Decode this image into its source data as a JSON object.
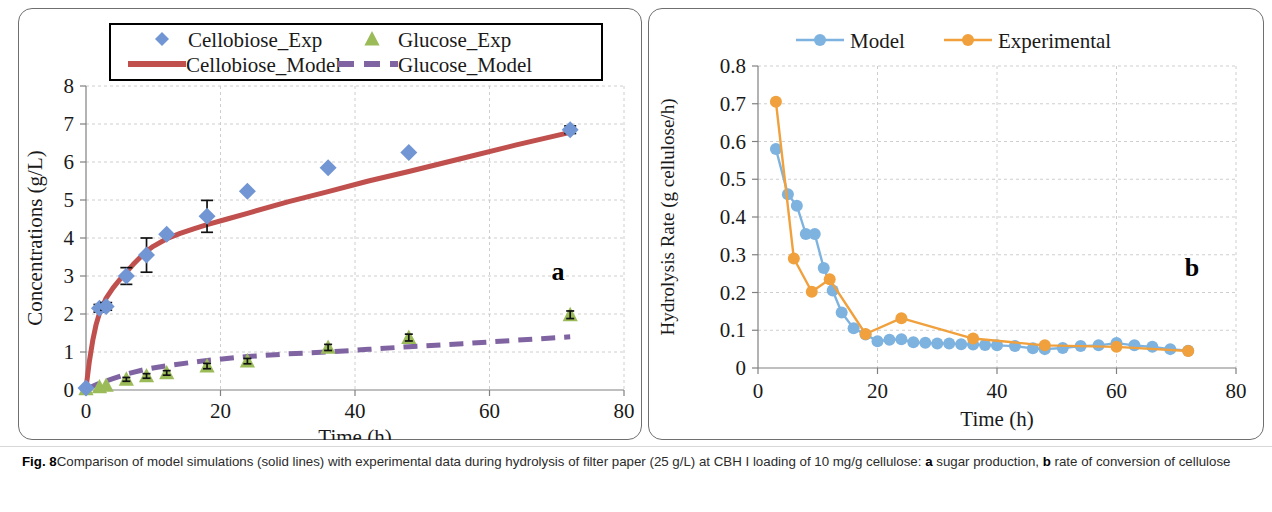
{
  "figure": {
    "label": "Fig. 8",
    "caption_part1": "Comparison of model simulations (solid lines) with experimental data during hydrolysis of filter paper (25 g/L) at CBH I loading of 10 mg/g cellulose: ",
    "caption_bold_a": "a",
    "caption_part2": " sugar production, ",
    "caption_bold_b": "b",
    "caption_part3": " rate of conversion of cellulose"
  },
  "colors": {
    "cellobiose_marker": "#7296d4",
    "cellobiose_model": "#c0504d",
    "glucose_marker": "#9bbb59",
    "glucose_model": "#8064a2",
    "model_blue": "#7eb3e0",
    "experimental_orange": "#f0a03c",
    "grid": "#c8c8c8",
    "axis": "#808080",
    "frame": "#6f6f6f"
  },
  "chart_data": [
    {
      "type": "scatter",
      "panel": "a",
      "panel_letter": "a",
      "title": "",
      "xlabel": "Time (h)",
      "ylabel": "Concentrations (g/L)",
      "xlim": [
        0,
        80
      ],
      "ylim": [
        0,
        8
      ],
      "xticks": [
        0,
        20,
        40,
        60,
        80
      ],
      "yticks": [
        0,
        1,
        2,
        3,
        4,
        5,
        6,
        7,
        8
      ],
      "grid": true,
      "legend_position": "top",
      "legend": [
        {
          "label": "Cellobiose_Exp",
          "marker": "diamond",
          "color": "#7296d4"
        },
        {
          "label": "Glucose_Exp",
          "marker": "triangle",
          "color": "#9bbb59"
        },
        {
          "label": "Cellobiose_Model",
          "marker": "solid-line",
          "color": "#c0504d"
        },
        {
          "label": "Glucose_Model",
          "marker": "dashed-line",
          "color": "#8064a2"
        }
      ],
      "series": [
        {
          "name": "Cellobiose_Exp",
          "kind": "markers",
          "marker": "diamond",
          "color": "#7296d4",
          "x": [
            0,
            2,
            3,
            6,
            9,
            12,
            18,
            24,
            36,
            48,
            72
          ],
          "y": [
            0.05,
            2.15,
            2.2,
            3.0,
            3.55,
            4.1,
            4.57,
            5.23,
            5.85,
            6.25,
            6.85
          ],
          "yerr": [
            0,
            0.1,
            0.1,
            0.22,
            0.45,
            0,
            0.42,
            0,
            0,
            0,
            0.1
          ]
        },
        {
          "name": "Glucose_Exp",
          "kind": "markers",
          "marker": "triangle",
          "color": "#9bbb59",
          "x": [
            0,
            2,
            3,
            6,
            9,
            12,
            18,
            24,
            36,
            48,
            72
          ],
          "y": [
            0.03,
            0.08,
            0.12,
            0.28,
            0.37,
            0.45,
            0.63,
            0.76,
            1.12,
            1.38,
            1.98
          ],
          "yerr": [
            0,
            0,
            0,
            0.05,
            0.06,
            0.06,
            0.07,
            0.07,
            0.08,
            0.09,
            0.1
          ]
        },
        {
          "name": "Cellobiose_Model",
          "kind": "line",
          "style": "solid",
          "color": "#c0504d",
          "x": [
            0,
            0.5,
            1,
            1.5,
            2,
            3,
            4,
            5,
            6,
            7,
            8,
            9,
            10,
            12,
            14,
            16,
            18,
            21,
            24,
            30,
            36,
            42,
            48,
            56,
            64,
            72
          ],
          "y": [
            0.05,
            0.75,
            1.3,
            1.72,
            2.02,
            2.42,
            2.68,
            2.9,
            3.1,
            3.3,
            3.48,
            3.65,
            3.78,
            3.98,
            4.12,
            4.24,
            4.35,
            4.5,
            4.65,
            4.95,
            5.22,
            5.5,
            5.75,
            6.1,
            6.45,
            6.78
          ]
        },
        {
          "name": "Glucose_Model",
          "kind": "line",
          "style": "dashed",
          "color": "#8064a2",
          "x": [
            0,
            2,
            4,
            6,
            9,
            12,
            18,
            24,
            30,
            36,
            42,
            48,
            56,
            64,
            72
          ],
          "y": [
            0.02,
            0.18,
            0.3,
            0.42,
            0.55,
            0.64,
            0.78,
            0.88,
            0.95,
            1.0,
            1.07,
            1.14,
            1.22,
            1.31,
            1.4
          ]
        }
      ]
    },
    {
      "type": "line",
      "panel": "b",
      "panel_letter": "b",
      "title": "",
      "xlabel": "Time (h)",
      "ylabel": "Hydrolysis Rate (g cellulose/h)",
      "xlim": [
        0,
        80
      ],
      "ylim": [
        0,
        0.8
      ],
      "xticks": [
        0,
        20,
        40,
        60,
        80
      ],
      "yticks": [
        0,
        0.1,
        0.2,
        0.3,
        0.4,
        0.5,
        0.6,
        0.7,
        0.8
      ],
      "ytick_labels": [
        "0",
        "0.1",
        "0.2",
        "0.3",
        "0.4",
        "0.5",
        "0.6",
        "0.7",
        "0.8"
      ],
      "grid": true,
      "legend_position": "top",
      "legend": [
        {
          "label": "Model",
          "marker": "line-circle",
          "color": "#7eb3e0"
        },
        {
          "label": "Experimental",
          "marker": "line-circle",
          "color": "#f0a03c"
        }
      ],
      "series": [
        {
          "name": "Model",
          "kind": "line-markers",
          "color": "#7eb3e0",
          "x": [
            3,
            5,
            6.5,
            8,
            9.5,
            11,
            12.5,
            14,
            16,
            18,
            20,
            22,
            24,
            26,
            28,
            30,
            32,
            34,
            36,
            38,
            40,
            43,
            46,
            48,
            51,
            54,
            57,
            60,
            63,
            66,
            69,
            72
          ],
          "y": [
            0.58,
            0.46,
            0.43,
            0.355,
            0.355,
            0.265,
            0.205,
            0.147,
            0.105,
            0.089,
            0.071,
            0.075,
            0.076,
            0.068,
            0.067,
            0.065,
            0.065,
            0.063,
            0.062,
            0.061,
            0.06,
            0.058,
            0.052,
            0.05,
            0.053,
            0.058,
            0.06,
            0.066,
            0.06,
            0.056,
            0.05,
            0.046
          ]
        },
        {
          "name": "Experimental",
          "kind": "line-markers",
          "color": "#f0a03c",
          "x": [
            3,
            6,
            9,
            12,
            18,
            24,
            36,
            48,
            60,
            72
          ],
          "y": [
            0.705,
            0.29,
            0.202,
            0.235,
            0.09,
            0.132,
            0.078,
            0.06,
            0.056,
            0.045
          ]
        }
      ]
    }
  ]
}
